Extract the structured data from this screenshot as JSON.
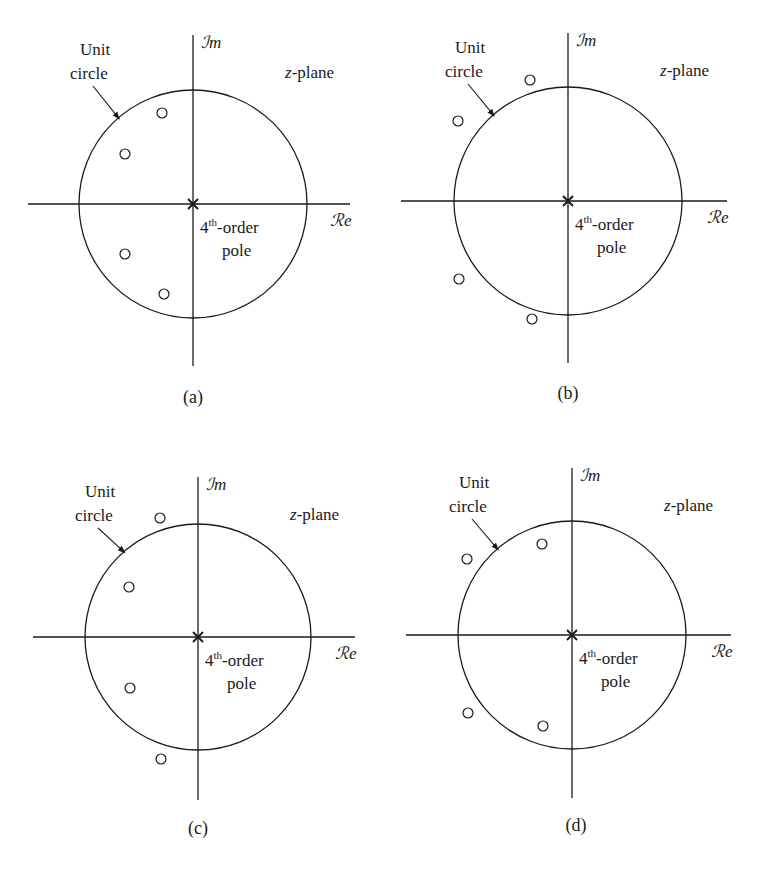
{
  "figure": {
    "common_labels": {
      "imag_axis": "ℐm",
      "real_axis": "ℛe",
      "plane": "z-plane",
      "plane_var": "z",
      "plane_suffix": "-plane",
      "unit_circle_line1": "Unit",
      "unit_circle_line2": "circle",
      "pole_label_prefix": "4",
      "pole_label_sup": "th",
      "pole_label_suffix": "-order",
      "pole_label_line2": "pole"
    },
    "panels": [
      {
        "id": "a",
        "caption": "(a)",
        "center": [
          193,
          204
        ],
        "radius": 114,
        "h_axis": [
          28,
          350
        ],
        "v_axis": [
          35,
          366
        ],
        "zeros": [
          [
            162,
            113
          ],
          [
            125,
            154
          ],
          [
            125,
            254
          ],
          [
            164,
            294
          ]
        ],
        "caption_pos": [
          193,
          403
        ]
      },
      {
        "id": "b",
        "caption": "(b)",
        "center": [
          568,
          201
        ],
        "radius": 114,
        "h_axis": [
          401,
          727
        ],
        "v_axis": [
          33,
          363
        ],
        "zeros": [
          [
            530,
            80
          ],
          [
            458,
            121
          ],
          [
            459,
            279
          ],
          [
            532,
            319
          ]
        ],
        "caption_pos": [
          568,
          399
        ]
      },
      {
        "id": "c",
        "caption": "(c)",
        "center": [
          198,
          637
        ],
        "radius": 113,
        "h_axis": [
          33,
          355
        ],
        "v_axis": [
          477,
          800
        ],
        "zeros": [
          [
            160,
            518
          ],
          [
            129,
            587
          ],
          [
            130,
            688
          ],
          [
            161,
            759
          ]
        ],
        "caption_pos": [
          198,
          834
        ]
      },
      {
        "id": "d",
        "caption": "(d)",
        "center": [
          572,
          635
        ],
        "radius": 114,
        "h_axis": [
          406,
          731
        ],
        "v_axis": [
          468,
          798
        ],
        "zeros": [
          [
            542,
            544
          ],
          [
            467,
            559
          ],
          [
            468,
            713
          ],
          [
            543,
            726
          ]
        ],
        "caption_pos": [
          576,
          831
        ]
      }
    ],
    "colors": {
      "ink": "#1a1a1a",
      "background": "#ffffff"
    }
  }
}
